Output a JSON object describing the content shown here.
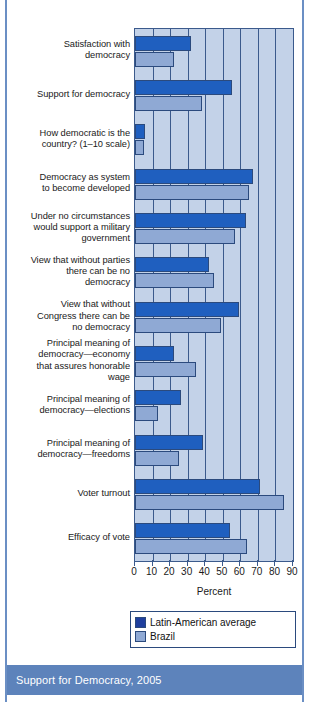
{
  "caption": {
    "text": "Support for Democracy, 2005"
  },
  "chart_data": {
    "type": "bar",
    "orientation": "horizontal",
    "title": "",
    "xlabel": "Percent",
    "ylabel": "",
    "xlim": [
      0,
      90
    ],
    "xticks": [
      0,
      10,
      20,
      30,
      40,
      50,
      60,
      70,
      80,
      90
    ],
    "grid": true,
    "legend_position": "below-axis",
    "categories": [
      "Satisfaction with democracy",
      "Support for democracy",
      "How democratic is the country? (1–10 scale)",
      "Democracy as system to become developed",
      "Under no circumstances would support a military government",
      "View that without parties there can be no democracy",
      "View that without Congress there can be no democracy",
      "Principal meaning of democracy—economy that assures honorable wage",
      "Principal meaning of democracy—elections",
      "Principal meaning of democracy—freedoms",
      "Voter turnout",
      "Efficacy of vote"
    ],
    "category_lines": [
      [
        "Satisfaction with",
        "democracy"
      ],
      [
        "Support for democracy"
      ],
      [
        "How democratic is the",
        "country? (1–10 scale)"
      ],
      [
        "Democracy as system",
        "to become developed"
      ],
      [
        "Under no circumstances",
        "would support a military",
        "government"
      ],
      [
        "View that without parties",
        "there can be no",
        "democracy"
      ],
      [
        "View that without",
        "Congress there can be",
        "no democracy"
      ],
      [
        "Principal meaning of",
        "democracy—economy",
        "that assures honorable",
        "wage"
      ],
      [
        "Principal meaning of",
        "democracy—elections"
      ],
      [
        "Principal meaning of",
        "democracy—freedoms"
      ],
      [
        "Voter turnout"
      ],
      [
        "Efficacy of vote"
      ]
    ],
    "series": [
      {
        "name": "Latin-American average",
        "color": "#1f5fbf",
        "legend_color": "#1f3f9e",
        "values": [
          32,
          55,
          5.5,
          67,
          63,
          42,
          59,
          22,
          26,
          39,
          71,
          54
        ]
      },
      {
        "name": "Brazil",
        "color": "#8fa9d4",
        "legend_color": "#8fa9d4",
        "values": [
          22,
          38,
          5,
          65,
          57,
          45,
          49,
          35,
          13,
          25,
          85,
          64
        ]
      }
    ]
  },
  "colors": {
    "plot_background": "#c3d2e8",
    "axis": "#3b5a8c",
    "caption_bar": "#5d83bb",
    "caption_text": "#ffffff",
    "series_dark": "#1f5fbf",
    "series_light": "#8fa9d4"
  }
}
